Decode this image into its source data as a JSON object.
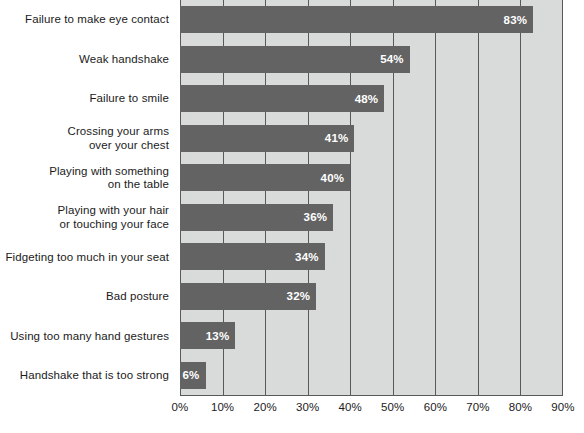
{
  "chart_data": {
    "type": "bar",
    "orientation": "horizontal",
    "title": "",
    "subtitle": "",
    "xlabel": "",
    "ylabel": "",
    "xlim": [
      0,
      90
    ],
    "grid": true,
    "legend": null,
    "categories": [
      "Failure to make eye contact",
      "Weak handshake",
      "Failure to smile",
      "Crossing your arms\nover your chest",
      "Playing with something\non the table",
      "Playing with your hair\nor touching your face",
      "Fidgeting too much in your seat",
      "Bad posture",
      "Using too many hand gestures",
      "Handshake that is too strong"
    ],
    "values": [
      83,
      54,
      48,
      41,
      40,
      36,
      34,
      32,
      13,
      6
    ],
    "value_labels": [
      "83%",
      "54%",
      "48%",
      "41%",
      "40%",
      "36%",
      "34%",
      "32%",
      "13%",
      "6%"
    ],
    "xticks": [
      0,
      10,
      20,
      30,
      40,
      50,
      60,
      70,
      80,
      90
    ],
    "xtick_labels": [
      "0%",
      "10%",
      "20%",
      "30%",
      "40%",
      "50%",
      "60%",
      "70%",
      "80%",
      "90%"
    ],
    "colors": {
      "bar_fill": "#636363",
      "plot_background": "#d9dada",
      "gridline": "#58595b",
      "value_text": "#ffffff",
      "label_text": "#1b1b1b",
      "page_background": "#ffffff"
    }
  }
}
